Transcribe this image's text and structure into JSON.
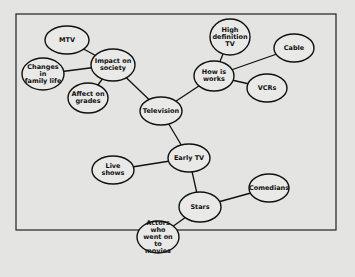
{
  "diagram": {
    "type": "concept-map",
    "colors": {
      "background": "#e4e4e2",
      "stroke": "#111111",
      "node_fill": "#e9e9e7"
    },
    "frame": {
      "x": 16,
      "y": 14,
      "width": 320,
      "height": 216
    },
    "nodes": [
      {
        "id": "mtv",
        "label": "MTV",
        "cx": 67,
        "cy": 40,
        "rx": 22,
        "ry": 14
      },
      {
        "id": "impact",
        "label": "Impact on\nsociety",
        "cx": 113,
        "cy": 65,
        "rx": 22,
        "ry": 16
      },
      {
        "id": "changes",
        "label": "Changes in\nfamily life",
        "cx": 43,
        "cy": 74,
        "rx": 21,
        "ry": 16
      },
      {
        "id": "grades",
        "label": "Affect on\ngrades",
        "cx": 88,
        "cy": 98,
        "rx": 20,
        "ry": 15
      },
      {
        "id": "television",
        "label": "Television",
        "cx": 161,
        "cy": 111,
        "rx": 21,
        "ry": 14
      },
      {
        "id": "hdtv",
        "label": "High\ndefinition\nTV",
        "cx": 230,
        "cy": 37,
        "rx": 20,
        "ry": 18
      },
      {
        "id": "works",
        "label": "How is\nworks",
        "cx": 214,
        "cy": 76,
        "rx": 20,
        "ry": 15
      },
      {
        "id": "cable",
        "label": "Cable",
        "cx": 294,
        "cy": 48,
        "rx": 20,
        "ry": 14
      },
      {
        "id": "vcrs",
        "label": "VCRs",
        "cx": 267,
        "cy": 88,
        "rx": 20,
        "ry": 14
      },
      {
        "id": "earlytv",
        "label": "Early TV",
        "cx": 189,
        "cy": 158,
        "rx": 21,
        "ry": 14
      },
      {
        "id": "live",
        "label": "Live shows",
        "cx": 113,
        "cy": 170,
        "rx": 21,
        "ry": 14
      },
      {
        "id": "stars",
        "label": "Stars",
        "cx": 200,
        "cy": 207,
        "rx": 21,
        "ry": 15
      },
      {
        "id": "comedians",
        "label": "Comedians",
        "cx": 269,
        "cy": 188,
        "rx": 20,
        "ry": 14
      },
      {
        "id": "actors",
        "label": "Actors who\nwent on to\nmovies",
        "cx": 158,
        "cy": 237,
        "rx": 21,
        "ry": 16
      }
    ],
    "edges": [
      [
        "mtv",
        "impact"
      ],
      [
        "changes",
        "impact"
      ],
      [
        "grades",
        "impact"
      ],
      [
        "impact",
        "television"
      ],
      [
        "television",
        "works"
      ],
      [
        "hdtv",
        "works"
      ],
      [
        "works",
        "cable"
      ],
      [
        "works",
        "vcrs"
      ],
      [
        "television",
        "earlytv"
      ],
      [
        "live",
        "earlytv"
      ],
      [
        "earlytv",
        "stars"
      ],
      [
        "stars",
        "comedians"
      ],
      [
        "stars",
        "actors"
      ]
    ]
  }
}
